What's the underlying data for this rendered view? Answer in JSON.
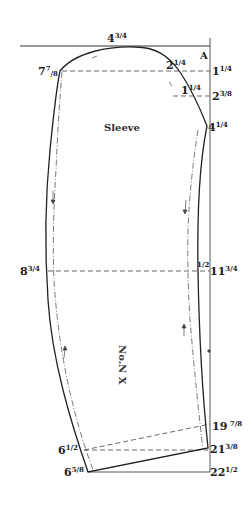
{
  "diagram": {
    "type": "garment-pattern-draft",
    "piece_label": "Sleeve",
    "pattern_number": "No.N X",
    "corner_label": "A",
    "line_color": "#222222"
  },
  "measurements": {
    "top_crown": {
      "whole": "4",
      "num": "3",
      "den": "4"
    },
    "top_left": {
      "whole": "7",
      "num": "7",
      "den": "8"
    },
    "right_1": {
      "whole": "1",
      "num": "1",
      "den": "4"
    },
    "curve_1": {
      "whole": "2",
      "num": "1",
      "den": "4"
    },
    "curve_2": {
      "whole": "1",
      "num": "1",
      "den": "4"
    },
    "right_2": {
      "whole": "2",
      "num": "3",
      "den": "8"
    },
    "right_3": {
      "whole": "4",
      "num": "1",
      "den": "4"
    },
    "elbow_left": {
      "whole": "8",
      "num": "3",
      "den": "4"
    },
    "elbow_half": {
      "whole": "",
      "num": "1",
      "den": "2"
    },
    "elbow_right": {
      "whole": "11",
      "num": "3",
      "den": "4"
    },
    "right_4": {
      "whole": "19",
      "num": "7",
      "den": "8"
    },
    "right_5": {
      "whole": "21",
      "num": "3",
      "den": "8"
    },
    "right_6": {
      "whole": "22",
      "num": "1",
      "den": "2"
    },
    "bottom_left_1": {
      "whole": "6",
      "num": "1",
      "den": "2"
    },
    "bottom_left_2": {
      "whole": "6",
      "num": "5",
      "den": "8"
    }
  }
}
